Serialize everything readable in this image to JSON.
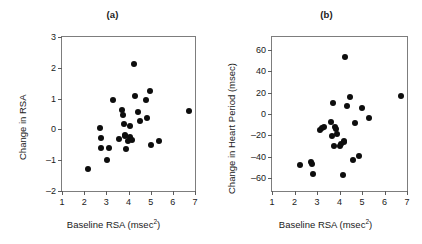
{
  "figure": {
    "background": "#ffffff",
    "point_color": "#0d0d0d",
    "axis_color": "#7d7d7d"
  },
  "panels": [
    {
      "title": "(a)",
      "xlabel_main": "Baseline RSA (msec",
      "xlabel_sup": "2",
      "xlabel_tail": ")",
      "ylabel": "Change in RSA",
      "xticks": [
        "1",
        "2",
        "3",
        "4",
        "5",
        "6",
        "7"
      ],
      "yticks": [
        "3",
        "2",
        "1",
        "0",
        "-1",
        "-2"
      ]
    },
    {
      "title": "(b)",
      "xlabel_main": "Baseline RSA (msec",
      "xlabel_sup": "2",
      "xlabel_tail": ")",
      "ylabel": "Change in Heart Period (msec)",
      "xticks": [
        "1",
        "2",
        "3",
        "4",
        "5",
        "6",
        "7"
      ],
      "yticks": [
        "60",
        "40",
        "20",
        "0",
        "-20",
        "-40",
        "-60"
      ]
    }
  ],
  "chart_data": [
    {
      "type": "scatter",
      "title": "(a)",
      "xlabel": "Baseline RSA (msec^2)",
      "ylabel": "Change in RSA",
      "xlim": [
        1,
        7
      ],
      "ylim": [
        -2,
        3
      ],
      "xticks": [
        1,
        2,
        3,
        4,
        5,
        6,
        7
      ],
      "yticks": [
        -2,
        -1,
        0,
        1,
        2,
        3
      ],
      "grid": false,
      "legend": "none",
      "marker": "filled-circle",
      "points": [
        [
          2.18,
          -1.28
        ],
        [
          2.72,
          0.06
        ],
        [
          2.75,
          -0.29
        ],
        [
          2.78,
          -0.6
        ],
        [
          3.05,
          -0.98
        ],
        [
          3.12,
          -0.61
        ],
        [
          3.3,
          0.95
        ],
        [
          3.58,
          -0.3
        ],
        [
          3.72,
          0.62
        ],
        [
          3.74,
          0.48
        ],
        [
          3.8,
          0.18
        ],
        [
          3.82,
          -0.17
        ],
        [
          3.85,
          -0.22
        ],
        [
          3.88,
          -0.65
        ],
        [
          3.98,
          -0.38
        ],
        [
          4.05,
          0.12
        ],
        [
          4.08,
          -0.25
        ],
        [
          4.18,
          -0.35
        ],
        [
          4.25,
          2.13
        ],
        [
          4.3,
          1.08
        ],
        [
          4.42,
          0.55
        ],
        [
          4.52,
          0.28
        ],
        [
          4.78,
          0.95
        ],
        [
          4.82,
          0.37
        ],
        [
          4.95,
          1.24
        ],
        [
          5.02,
          -0.52
        ],
        [
          5.38,
          -0.37
        ],
        [
          6.72,
          0.6
        ]
      ]
    },
    {
      "type": "scatter",
      "title": "(b)",
      "xlabel": "Baseline RSA (msec^2)",
      "ylabel": "Change in Heart Period (msec)",
      "xlim": [
        1,
        7
      ],
      "ylim": [
        -72,
        72
      ],
      "xticks": [
        1,
        2,
        3,
        4,
        5,
        6,
        7
      ],
      "yticks": [
        -60,
        -40,
        -20,
        0,
        20,
        40,
        60
      ],
      "grid": false,
      "legend": "none",
      "marker": "filled-circle",
      "points": [
        [
          2.25,
          -47.5
        ],
        [
          2.72,
          -45.0
        ],
        [
          2.78,
          -47.0
        ],
        [
          2.8,
          -56.5
        ],
        [
          3.12,
          -14.5
        ],
        [
          3.22,
          -13.0
        ],
        [
          3.3,
          -12.5
        ],
        [
          3.62,
          -7.5
        ],
        [
          3.65,
          -21.0
        ],
        [
          3.72,
          10.0
        ],
        [
          3.75,
          -29.5
        ],
        [
          3.8,
          -12.5
        ],
        [
          3.85,
          -14.0
        ],
        [
          3.88,
          -18.5
        ],
        [
          4.02,
          -30.0
        ],
        [
          4.08,
          -28.0
        ],
        [
          4.15,
          -57.5
        ],
        [
          4.18,
          -25.5
        ],
        [
          4.22,
          -26.0
        ],
        [
          4.25,
          53.0
        ],
        [
          4.35,
          7.5
        ],
        [
          4.45,
          16.0
        ],
        [
          4.62,
          -43.0
        ],
        [
          4.7,
          -8.0
        ],
        [
          4.88,
          -39.0
        ],
        [
          4.98,
          6.0
        ],
        [
          5.32,
          -3.5
        ],
        [
          6.72,
          17.0
        ]
      ]
    }
  ]
}
